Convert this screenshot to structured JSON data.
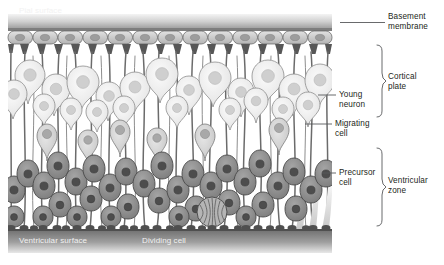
{
  "figure": {
    "width": 444,
    "height": 265
  },
  "colors": {
    "background": "#ffffff",
    "band_top_dark": "#8a8a8a",
    "band_top_light": "#d9d9d9",
    "band_bottom_dark": "#6e6e6e",
    "band_bottom_light": "#c9c9c9",
    "epithelial_fill": "#d2d2d2",
    "epithelial_nucleus": "#9a9a9a",
    "young_neuron_fill": "#ededed",
    "young_neuron_nucleus": "#cfcfcf",
    "migrating_cell_fill": "#d8d8d8",
    "migrating_cell_nucleus": "#a8a8a8",
    "precursor_fill": "#8e8e8e",
    "precursor_nucleus": "#4d4d4d",
    "fiber_stroke": "#6b6b6b",
    "outline": "#555555",
    "label_text": "#231f20",
    "band_text": "#f2f2f2",
    "leader_line": "#58595b"
  },
  "labels": {
    "pial_surface": "Pial surface",
    "ventricular_surface": "Ventricular surface",
    "dividing_cell": "Dividing cell",
    "basement_membrane": "Basement\nmembrane",
    "cortical_plate": "Cortical\nplate",
    "young_neuron": "Young\nneuron",
    "migrating_cell": "Migrating\ncell",
    "precursor_cell": "Precursor\ncell",
    "ventricular_zone": "Ventricular\nzone"
  },
  "zones": [
    {
      "name": "cortical-plate",
      "bracket_top": 45,
      "bracket_bottom": 118
    },
    {
      "name": "ventricular-zone",
      "bracket_top": 148,
      "bracket_bottom": 228
    }
  ],
  "geometry": {
    "diagram_left": 8,
    "diagram_right": 332,
    "top_band_y": 20,
    "top_band_h": 10,
    "epithelial_row_y": 30,
    "epithelial_row_h": 14,
    "bottom_band_y": 229,
    "bottom_band_h": 24,
    "ventricular_surface_y": 229
  },
  "cells": {
    "epithelial_count": 13,
    "young_neuron_count": 22,
    "migrating_cell_count": 6,
    "precursor_count": 34,
    "dividing_cell_count": 1,
    "radial_fiber_count": 26
  }
}
